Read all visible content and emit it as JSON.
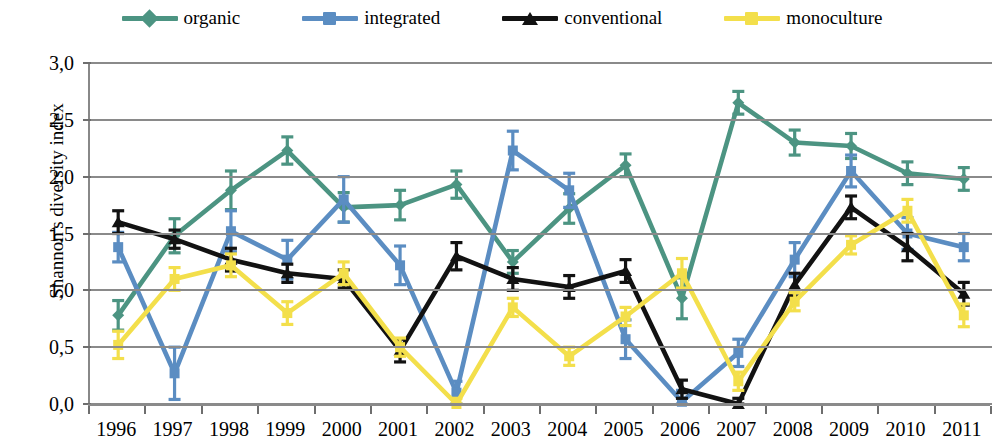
{
  "chart_data": {
    "type": "line",
    "title": "",
    "xlabel": "",
    "ylabel": "Shannon's diversity index",
    "grid": true,
    "legend_position": "top",
    "error_bars": true,
    "ylim": [
      0.0,
      3.0
    ],
    "ytick_labels": [
      "3,0",
      "2,5",
      "2,0",
      "1,5",
      "1,0",
      "0,5",
      "0,0"
    ],
    "ytick_values": [
      3.0,
      2.5,
      2.0,
      1.5,
      1.0,
      0.5,
      0.0
    ],
    "categories": [
      "1996",
      "1997",
      "1998",
      "1999",
      "2000",
      "2001",
      "2002",
      "2003",
      "2004",
      "2005",
      "2006",
      "2007",
      "2008",
      "2009",
      "2010",
      "2011"
    ],
    "series": [
      {
        "name": "organic",
        "color": "#4C9482",
        "marker": "diamond",
        "values": [
          0.78,
          1.48,
          1.88,
          2.23,
          1.73,
          1.75,
          1.93,
          1.25,
          1.72,
          2.1,
          0.93,
          2.65,
          2.3,
          2.27,
          2.03,
          1.98
        ],
        "err_low": [
          0.13,
          0.15,
          0.17,
          0.12,
          0.13,
          0.13,
          0.12,
          0.1,
          0.13,
          0.1,
          0.18,
          0.1,
          0.11,
          0.11,
          0.1,
          0.1
        ],
        "err_high": [
          0.13,
          0.15,
          0.17,
          0.12,
          0.13,
          0.13,
          0.12,
          0.1,
          0.13,
          0.1,
          0.18,
          0.1,
          0.11,
          0.11,
          0.1,
          0.1
        ]
      },
      {
        "name": "integrated",
        "color": "#5B8DC2",
        "marker": "square",
        "values": [
          1.38,
          0.27,
          1.52,
          1.27,
          1.8,
          1.22,
          0.1,
          2.23,
          1.88,
          0.57,
          0.02,
          0.45,
          1.27,
          2.05,
          1.5,
          1.38
        ],
        "err_low": [
          0.13,
          0.23,
          0.18,
          0.17,
          0.2,
          0.17,
          0.1,
          0.17,
          0.15,
          0.17,
          0.02,
          0.12,
          0.15,
          0.14,
          0.14,
          0.12
        ],
        "err_high": [
          0.13,
          0.23,
          0.18,
          0.17,
          0.2,
          0.17,
          0.1,
          0.17,
          0.15,
          0.17,
          0.1,
          0.12,
          0.15,
          0.14,
          0.14,
          0.12
        ]
      },
      {
        "name": "conventional",
        "color": "#121212",
        "marker": "triangle",
        "values": [
          1.6,
          1.45,
          1.27,
          1.15,
          1.1,
          0.47,
          1.3,
          1.1,
          1.03,
          1.17,
          0.13,
          0.0,
          1.05,
          1.73,
          1.38,
          0.97
        ],
        "err_low": [
          0.1,
          0.08,
          0.1,
          0.08,
          0.08,
          0.1,
          0.12,
          0.1,
          0.1,
          0.1,
          0.08,
          0.0,
          0.1,
          0.1,
          0.12,
          0.1
        ],
        "err_high": [
          0.1,
          0.08,
          0.1,
          0.08,
          0.08,
          0.1,
          0.12,
          0.1,
          0.1,
          0.1,
          0.08,
          0.05,
          0.1,
          0.1,
          0.12,
          0.1
        ]
      },
      {
        "name": "monoculture",
        "color": "#F3DF4B",
        "marker": "square",
        "values": [
          0.52,
          1.1,
          1.22,
          0.8,
          1.15,
          0.5,
          0.0,
          0.85,
          0.42,
          0.77,
          1.15,
          0.2,
          0.9,
          1.4,
          1.7,
          0.78
        ],
        "err_low": [
          0.12,
          0.1,
          0.1,
          0.1,
          0.1,
          0.08,
          0.0,
          0.08,
          0.08,
          0.08,
          0.13,
          0.08,
          0.08,
          0.08,
          0.1,
          0.1
        ],
        "err_high": [
          0.12,
          0.1,
          0.1,
          0.1,
          0.1,
          0.08,
          0.05,
          0.08,
          0.08,
          0.08,
          0.13,
          0.08,
          0.08,
          0.08,
          0.1,
          0.1
        ]
      }
    ]
  },
  "legend": {
    "items": [
      {
        "label": "organic",
        "color": "#4C9482",
        "marker": "diamond",
        "icon": "diamond-marker-icon"
      },
      {
        "label": "integrated",
        "color": "#5B8DC2",
        "marker": "square",
        "icon": "square-marker-icon"
      },
      {
        "label": "conventional",
        "color": "#121212",
        "marker": "triangle",
        "icon": "triangle-marker-icon"
      },
      {
        "label": "monoculture",
        "color": "#F3DF4B",
        "marker": "square",
        "icon": "square-marker-icon"
      }
    ]
  },
  "axes": {
    "y_title": "Shannon's diversity index",
    "y_ticks": [
      "3,0",
      "2,5",
      "2,0",
      "1,5",
      "1,0",
      "0,5",
      "0,0"
    ],
    "x_ticks": [
      "1996",
      "1997",
      "1998",
      "1999",
      "2000",
      "2001",
      "2002",
      "2003",
      "2004",
      "2005",
      "2006",
      "2007",
      "2008",
      "2009",
      "2010",
      "2011"
    ]
  }
}
